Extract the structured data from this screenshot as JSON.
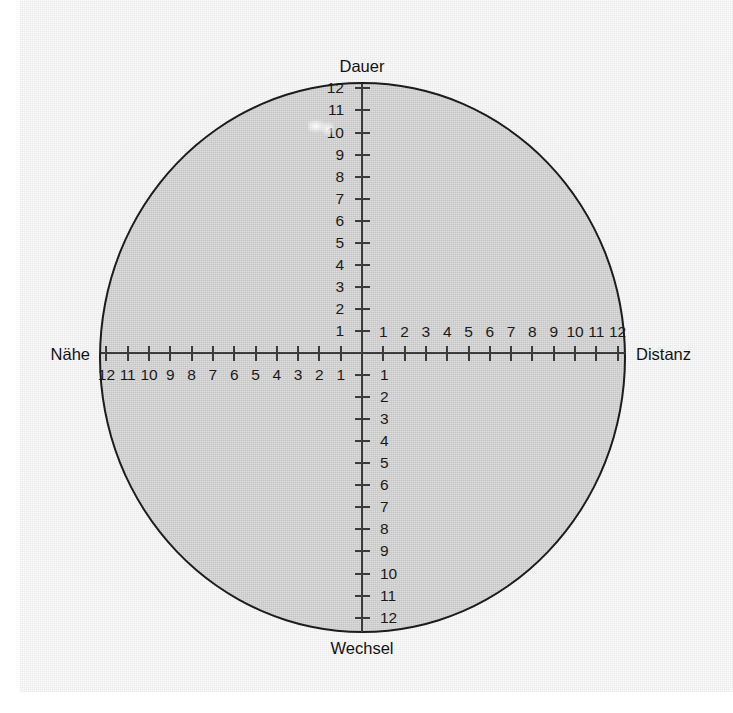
{
  "diagram": {
    "type": "quadrant-scale-circle",
    "poles": {
      "top": "Dauer",
      "bottom": "Wechsel",
      "left": "Nähe",
      "right": "Distanz"
    },
    "axes": {
      "vertical_up": {
        "pole": "Dauer",
        "ticks": [
          1,
          2,
          3,
          4,
          5,
          6,
          7,
          8,
          9,
          10,
          11,
          12
        ],
        "labels": [
          "1",
          "2",
          "3",
          "4",
          "5",
          "6",
          "7",
          "8",
          "9",
          "10",
          "11",
          "12"
        ],
        "label_side": "left"
      },
      "vertical_down": {
        "pole": "Wechsel",
        "ticks": [
          1,
          2,
          3,
          4,
          5,
          6,
          7,
          8,
          9,
          10,
          11,
          12
        ],
        "labels": [
          "1",
          "2",
          "3",
          "4",
          "5",
          "6",
          "7",
          "8",
          "9",
          "10",
          "11",
          "12"
        ],
        "label_side": "right"
      },
      "horizontal_left": {
        "pole": "Nähe",
        "ticks": [
          1,
          2,
          3,
          4,
          5,
          6,
          7,
          8,
          9,
          10,
          11,
          12
        ],
        "labels": [
          "1",
          "2",
          "3",
          "4",
          "5",
          "6",
          "7",
          "8",
          "9",
          "10",
          "11",
          "12"
        ],
        "label_side": "below"
      },
      "horizontal_right": {
        "pole": "Distanz",
        "ticks": [
          1,
          2,
          3,
          4,
          5,
          6,
          7,
          8,
          9,
          10,
          11,
          12
        ],
        "labels": [
          "1",
          "2",
          "3",
          "4",
          "5",
          "6",
          "7",
          "8",
          "9",
          "10",
          "11",
          "12"
        ],
        "label_side": "above"
      }
    },
    "colors": {
      "circle_fill": "#dcdcdc",
      "circle_stroke": "#1c1c1c",
      "axis": "#3b3b3b",
      "text": "#1a1a1a",
      "page": "#fbfbfb"
    }
  }
}
